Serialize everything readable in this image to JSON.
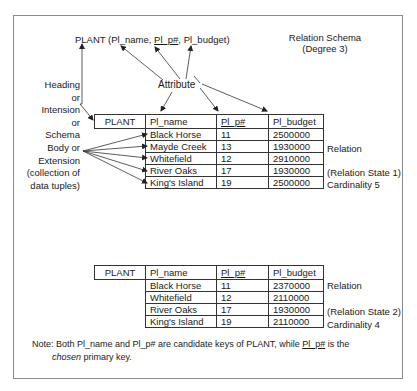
{
  "title": {
    "relation": "PLANT",
    "open": " (",
    "attr1": "Pl_name",
    "sep1": ", ",
    "attr2": "Pl_p#",
    "sep2": ", ",
    "attr3": "Pl_budget",
    "close": ")"
  },
  "schema_label": {
    "line1": "Relation Schema",
    "line2": "(Degree 3)"
  },
  "attribute_label": "Attribute",
  "heading_label": [
    "Heading",
    "or",
    "Intension",
    "or",
    "Schema"
  ],
  "body_label": [
    "Body or",
    "Extension",
    "(collection of",
    "data tuples)"
  ],
  "table1": {
    "headers": [
      "PLANT",
      "Pl_name",
      "Pl_p#",
      "Pl_budget"
    ],
    "rows": [
      [
        "Black Horse",
        "11",
        "2500000"
      ],
      [
        "Mayde Creek",
        "13",
        "1930000"
      ],
      [
        "Whitefield",
        "12",
        "2910000"
      ],
      [
        "River Oaks",
        "17",
        "1930000"
      ],
      [
        "King's Island",
        "19",
        "2500000"
      ]
    ],
    "labels": {
      "relation": "Relation",
      "state": "(Relation State 1)",
      "cardinality": "Cardinality 5"
    }
  },
  "table2": {
    "headers": [
      "PLANT",
      "Pl_name",
      "Pl_p#",
      "Pl_budget"
    ],
    "rows": [
      [
        "Black Horse",
        "11",
        "2370000"
      ],
      [
        "Whitefield",
        "12",
        "2110000"
      ],
      [
        "River Oaks",
        "17",
        "1930000"
      ],
      [
        "King's Island",
        "19",
        "2110000"
      ]
    ],
    "labels": {
      "relation": "Relation",
      "state": "(Relation State 2)",
      "cardinality": "Cardinality 4"
    }
  },
  "note": {
    "part1": "Note: Both Pl_name and Pl_p# are candidate keys of PLANT, while ",
    "key": "Pl_p#",
    "part2": " is the",
    "chosen": "chosen",
    "part3": " primary key."
  }
}
